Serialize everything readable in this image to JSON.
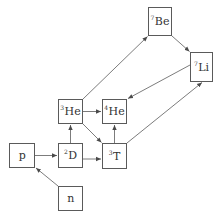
{
  "diagram": {
    "type": "nuclear-reaction-network",
    "colors": {
      "stroke": "#5a5a5a",
      "text": "#333333",
      "background": "#ffffff"
    },
    "nodes": [
      {
        "id": "p",
        "mass": "",
        "symbol": "p",
        "x": 9,
        "y": 143,
        "w": 26,
        "h": 25
      },
      {
        "id": "n",
        "mass": "",
        "symbol": "n",
        "x": 58,
        "y": 186,
        "w": 25,
        "h": 25
      },
      {
        "id": "D",
        "mass": "2",
        "symbol": "D",
        "x": 58,
        "y": 143,
        "w": 25,
        "h": 25
      },
      {
        "id": "T",
        "mass": "3",
        "symbol": "T",
        "x": 102,
        "y": 143,
        "w": 25,
        "h": 26
      },
      {
        "id": "He3",
        "mass": "3",
        "symbol": "He",
        "x": 58,
        "y": 99,
        "w": 25,
        "h": 25
      },
      {
        "id": "He4",
        "mass": "4",
        "symbol": "He",
        "x": 102,
        "y": 99,
        "w": 25,
        "h": 25
      },
      {
        "id": "Be7",
        "mass": "7",
        "symbol": "Be",
        "x": 148,
        "y": 7,
        "w": 24,
        "h": 29
      },
      {
        "id": "Li7",
        "mass": "7",
        "symbol": "Li",
        "x": 190,
        "y": 52,
        "w": 23,
        "h": 30
      }
    ],
    "edges": [
      {
        "from": "n",
        "to": "p"
      },
      {
        "from": "p",
        "to": "D"
      },
      {
        "from": "D",
        "to": "He3"
      },
      {
        "from": "D",
        "to": "T"
      },
      {
        "from": "He3",
        "to": "He4"
      },
      {
        "from": "He3",
        "to": "T"
      },
      {
        "from": "T",
        "to": "He4"
      },
      {
        "from": "He3",
        "to": "Be7"
      },
      {
        "from": "Be7",
        "to": "Li7"
      },
      {
        "from": "Li7",
        "to": "He4"
      },
      {
        "from": "T",
        "to": "Li7"
      }
    ]
  }
}
